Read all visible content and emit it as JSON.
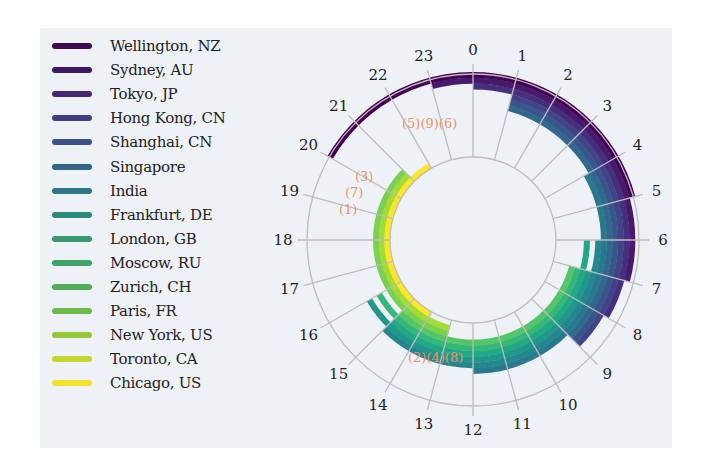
{
  "chart_data": {
    "type": "polar-stacked-ring",
    "title": "",
    "angular_axis": {
      "label": "Hour of day (UTC)",
      "ticks": [
        "0",
        "1",
        "2",
        "3",
        "4",
        "5",
        "6",
        "7",
        "8",
        "9",
        "10",
        "11",
        "12",
        "13",
        "14",
        "15",
        "16",
        "17",
        "18",
        "19",
        "20",
        "21",
        "22",
        "23"
      ],
      "direction": "clockwise",
      "zero_at": "top"
    },
    "grid": true,
    "legend_position": "left",
    "series": [
      {
        "name": "Wellington, NZ",
        "color": "#440154",
        "start_hour": 20,
        "end_hour": 5
      },
      {
        "name": "Sydney, AU",
        "color": "#481a6c",
        "start_hour": 23,
        "end_hour": 7
      },
      {
        "name": "Tokyo, JP",
        "color": "#472f7d",
        "start_hour": 0,
        "end_hour": 8
      },
      {
        "name": "Hong Kong, CN",
        "color": "#414487",
        "start_hour": 1,
        "end_hour": 9
      },
      {
        "name": "Shanghai, CN",
        "color": "#39568c",
        "start_hour": 1,
        "end_hour": 9
      },
      {
        "name": "Singapore",
        "color": "#31688e",
        "start_hour": 1,
        "end_hour": 9
      },
      {
        "name": "India",
        "color": "#2a788e",
        "start_hour": 4,
        "end_hour": 12
      },
      {
        "name": "Frankfurt, DE",
        "color": "#23888e",
        "start_hour": 6,
        "end_hour": 15
      },
      {
        "name": "London, GB",
        "color": "#1f988b",
        "start_hour": 7,
        "end_hour": 16
      },
      {
        "name": "Moscow, RU",
        "color": "#22a884",
        "start_hour": 6,
        "end_hour": 15
      },
      {
        "name": "Zurich, CH",
        "color": "#35b779",
        "start_hour": 7,
        "end_hour": 16
      },
      {
        "name": "Paris, FR",
        "color": "#54c568",
        "start_hour": 7,
        "end_hour": 15
      },
      {
        "name": "New York, US",
        "color": "#7ad151",
        "start_hour": 13,
        "end_hour": 21
      },
      {
        "name": "Toronto, CA",
        "color": "#a5db36",
        "start_hour": 13,
        "end_hour": 21
      },
      {
        "name": "Chicago, US",
        "color": "#fde725",
        "start_hour": 14,
        "end_hour": 22
      }
    ],
    "annotations": [
      {
        "text": "(5)",
        "hour": 22.6
      },
      {
        "text": "(9)",
        "hour": 23.0
      },
      {
        "text": "(6)",
        "hour": 23.4
      },
      {
        "text": "(3)",
        "hour": 20.4
      },
      {
        "text": "(7)",
        "hour": 19.9
      },
      {
        "text": "(1)",
        "hour": 19.3
      },
      {
        "text": "(2)",
        "hour": 13.4
      },
      {
        "text": "(4)",
        "hour": 13.0
      },
      {
        "text": "(8)",
        "hour": 12.6
      }
    ]
  },
  "legend": {
    "items": [
      {
        "label": "Wellington, NZ",
        "color": "#3b0a4f"
      },
      {
        "label": "Sydney, AU",
        "color": "#3e1560"
      },
      {
        "label": "Tokyo, JP",
        "color": "#42296f"
      },
      {
        "label": "Hong Kong, CN",
        "color": "#3f3f7f"
      },
      {
        "label": "Shanghai, CN",
        "color": "#3a5288"
      },
      {
        "label": "Singapore",
        "color": "#326588"
      },
      {
        "label": "India",
        "color": "#2c7786"
      },
      {
        "label": "Frankfurt, DE",
        "color": "#2b8a7e"
      },
      {
        "label": "London, GB",
        "color": "#3a9872"
      },
      {
        "label": "Moscow, RU",
        "color": "#3ea566"
      },
      {
        "label": "Zurich, CH",
        "color": "#4fae56"
      },
      {
        "label": "Paris, FR",
        "color": "#6cba4a"
      },
      {
        "label": "New York, US",
        "color": "#96c83c"
      },
      {
        "label": "Toronto, CA",
        "color": "#c4d632"
      },
      {
        "label": "Chicago, US",
        "color": "#f3e22a"
      }
    ]
  },
  "hour_labels": [
    "0",
    "1",
    "2",
    "3",
    "4",
    "5",
    "6",
    "7",
    "8",
    "9",
    "10",
    "11",
    "12",
    "13",
    "14",
    "15",
    "16",
    "17",
    "18",
    "19",
    "20",
    "21",
    "22",
    "23"
  ],
  "annotation_labels": {
    "top": "(5)(9)(6)",
    "left_a": "(3)",
    "left_b": "(7)",
    "left_c": "(1)",
    "bottom": "(2)(4)(8)"
  }
}
